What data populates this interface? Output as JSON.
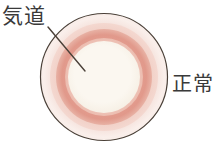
{
  "figure": {
    "background_color": "#ffffff"
  },
  "labels": {
    "airway": {
      "text": "気道",
      "meaning": "airway",
      "x": 2,
      "y": 6,
      "font_size": 21,
      "color": "#3a3a3a"
    },
    "normal": {
      "text": "正常",
      "meaning": "normal",
      "x": 172,
      "y": 74,
      "font_size": 20,
      "color": "#3a3a3a"
    }
  },
  "leader_line": {
    "name": "airway-leader-line",
    "x1": 48,
    "y1": 27,
    "x2": 85,
    "y2": 71,
    "color": "#4a4038",
    "width": 1.4
  },
  "diagram": {
    "center_x": 104,
    "center_y": 77,
    "layers": [
      {
        "name": "outer-outline",
        "label": "外周輪郭",
        "radius": 64,
        "color": "#f7ece8",
        "stroke": "#4a4038",
        "stroke_width": 1.2
      },
      {
        "name": "outer-pale-ring",
        "label": "外層（淡いピンク）",
        "radius": 62,
        "color": "#f6e2dc"
      },
      {
        "name": "mid-pink-ring",
        "label": "中間層",
        "radius": 54,
        "color": "#f0cec5"
      },
      {
        "name": "muscle-salmon-ring",
        "label": "平滑筋層（サーモン）",
        "radius": 48,
        "color": "#e39d90"
      },
      {
        "name": "inner-pink-ring",
        "label": "内側のピンク",
        "radius": 40,
        "color": "#eec3b8"
      },
      {
        "name": "lumen",
        "label": "内腔（気道）",
        "radius": 36,
        "color": "#f9f4ec"
      }
    ]
  }
}
